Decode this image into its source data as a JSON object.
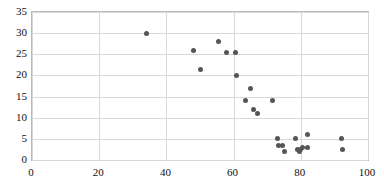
{
  "chart_data": {
    "type": "scatter",
    "title": "",
    "subtitle": "",
    "xlabel": "",
    "ylabel": "",
    "xlim": [
      0,
      100
    ],
    "ylim": [
      0,
      35
    ],
    "xticks": [
      0,
      20,
      40,
      60,
      80,
      100
    ],
    "yticks": [
      0,
      5,
      10,
      15,
      20,
      25,
      30,
      35
    ],
    "grid": true,
    "legend": null,
    "marker_color": "#555555",
    "grid_color": "#d8d8d8",
    "frame_color": "#b9b9b9",
    "series": [
      {
        "name": "series-1",
        "points": [
          [
            34,
            30
          ],
          [
            48,
            26
          ],
          [
            50,
            21.5
          ],
          [
            55.5,
            28
          ],
          [
            58,
            25.5
          ],
          [
            60.5,
            25.5
          ],
          [
            61,
            20
          ],
          [
            63.5,
            14
          ],
          [
            65,
            17
          ],
          [
            66,
            12
          ],
          [
            67,
            11
          ],
          [
            71.5,
            14
          ],
          [
            73,
            5
          ],
          [
            73.5,
            3.5
          ],
          [
            74.5,
            3.5
          ],
          [
            75,
            2
          ],
          [
            78.5,
            5
          ],
          [
            79,
            2.5
          ],
          [
            79.5,
            2
          ],
          [
            80,
            2.5
          ],
          [
            80.5,
            3
          ],
          [
            82,
            6
          ],
          [
            82,
            3
          ],
          [
            92,
            5
          ],
          [
            92.5,
            2.5
          ]
        ]
      }
    ]
  }
}
